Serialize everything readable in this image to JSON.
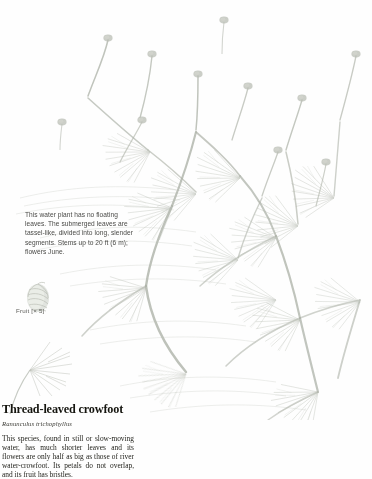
{
  "page": {
    "background_color": "#fefefe",
    "ink_color": "#a9aea4"
  },
  "illustration": {
    "subject": "thread-leaved-crowfoot-plant",
    "style": "pale watercolour and pencil botanical plate",
    "stroke_color": "#b2b7ad",
    "leaf_color": "#b8bdb3",
    "bud_color": "#a8ada3"
  },
  "fruit_inset": {
    "icon": "fruit-achene-icon",
    "label": "Fruit [× 5]"
  },
  "caption": {
    "lines": [
      "This water plant has no floating",
      "leaves. The submerged leaves are",
      "tassel-like, divided into long, slender",
      "segments. Stems up to 20 ft (6 m);",
      "flowers June."
    ]
  },
  "entry": {
    "title": "Thread-leaved crowfoot",
    "binomial": "Ranunculus trichophyllus",
    "body": "This species, found in still or slow-moving water, has much shorter leaves and its flowers are only half as big as those of river water-crowfoot. Its petals do not overlap, and its fruit has bristles."
  }
}
